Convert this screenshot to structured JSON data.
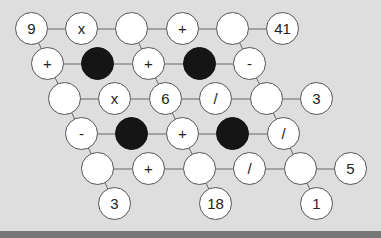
{
  "puzzle": {
    "radius": 17,
    "edge_color": "#666666",
    "cells": [
      {
        "x": 32,
        "y": 29,
        "text": "9",
        "type": "given"
      },
      {
        "x": 82,
        "y": 29,
        "text": "x",
        "type": "operator"
      },
      {
        "x": 132,
        "y": 29,
        "text": "",
        "type": "empty"
      },
      {
        "x": 183,
        "y": 29,
        "text": "+",
        "type": "operator"
      },
      {
        "x": 233,
        "y": 29,
        "text": "",
        "type": "empty"
      },
      {
        "x": 283,
        "y": 29,
        "text": "41",
        "type": "given"
      },
      {
        "x": 48,
        "y": 64,
        "text": "+",
        "type": "operator"
      },
      {
        "x": 98,
        "y": 64,
        "text": "",
        "type": "black"
      },
      {
        "x": 149,
        "y": 64,
        "text": "+",
        "type": "operator"
      },
      {
        "x": 200,
        "y": 64,
        "text": "",
        "type": "black"
      },
      {
        "x": 250,
        "y": 64,
        "text": "-",
        "type": "operator"
      },
      {
        "x": 65,
        "y": 99,
        "text": "",
        "type": "empty"
      },
      {
        "x": 115,
        "y": 99,
        "text": "x",
        "type": "operator"
      },
      {
        "x": 166,
        "y": 99,
        "text": "6",
        "type": "given"
      },
      {
        "x": 216,
        "y": 99,
        "text": "/",
        "type": "operator"
      },
      {
        "x": 267,
        "y": 99,
        "text": "",
        "type": "empty"
      },
      {
        "x": 317,
        "y": 99,
        "text": "3",
        "type": "given"
      },
      {
        "x": 82,
        "y": 134,
        "text": "-",
        "type": "operator"
      },
      {
        "x": 132,
        "y": 134,
        "text": "",
        "type": "black"
      },
      {
        "x": 183,
        "y": 134,
        "text": "+",
        "type": "operator"
      },
      {
        "x": 233,
        "y": 134,
        "text": "",
        "type": "black"
      },
      {
        "x": 284,
        "y": 134,
        "text": "/",
        "type": "operator"
      },
      {
        "x": 98,
        "y": 169,
        "text": "",
        "type": "empty"
      },
      {
        "x": 149,
        "y": 169,
        "text": "+",
        "type": "operator"
      },
      {
        "x": 200,
        "y": 169,
        "text": "",
        "type": "empty"
      },
      {
        "x": 250,
        "y": 169,
        "text": "/",
        "type": "operator"
      },
      {
        "x": 301,
        "y": 169,
        "text": "",
        "type": "empty"
      },
      {
        "x": 351,
        "y": 169,
        "text": "5",
        "type": "given"
      },
      {
        "x": 115,
        "y": 204,
        "text": "3",
        "type": "given"
      },
      {
        "x": 216,
        "y": 204,
        "text": "18",
        "type": "given"
      },
      {
        "x": 317,
        "y": 204,
        "text": "1",
        "type": "given"
      }
    ],
    "edges": [
      [
        32,
        29,
        283,
        29
      ],
      [
        48,
        64,
        250,
        64
      ],
      [
        65,
        99,
        317,
        99
      ],
      [
        82,
        134,
        284,
        134
      ],
      [
        98,
        169,
        351,
        169
      ],
      [
        32,
        29,
        115,
        204
      ],
      [
        132,
        29,
        216,
        204
      ],
      [
        233,
        29,
        317,
        204
      ]
    ]
  }
}
